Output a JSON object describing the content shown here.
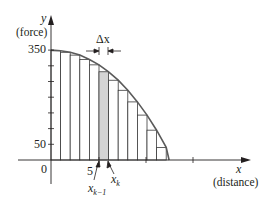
{
  "chart_data": {
    "type": "bar",
    "title": "",
    "xlabel": "x",
    "xlabel_sub": "(distance)",
    "ylabel": "y",
    "ylabel_sub": "(force)",
    "y_tick_labels": [
      "350",
      "50"
    ],
    "y_ticks": [
      350,
      300,
      250,
      200,
      150,
      100,
      50
    ],
    "x_tick_labels": [
      "0",
      "5"
    ],
    "x_ticks": [
      5,
      10,
      15
    ],
    "ylim": [
      0,
      380
    ],
    "xlim": [
      0,
      17
    ],
    "grid": false,
    "legend": null,
    "curve": {
      "description": "force curve, decreasing from 350 at x=0 to 0 near x=12",
      "points": [
        [
          0,
          350
        ],
        [
          1,
          348
        ],
        [
          2,
          343
        ],
        [
          3,
          334
        ],
        [
          4,
          320
        ],
        [
          5,
          303
        ],
        [
          6,
          281
        ],
        [
          7,
          254
        ],
        [
          8,
          222
        ],
        [
          9,
          185
        ],
        [
          10,
          143
        ],
        [
          11,
          95
        ],
        [
          12,
          40
        ],
        [
          12.3,
          0
        ]
      ]
    },
    "bars": {
      "count": 12,
      "width": 1,
      "x_left": [
        0,
        1,
        2,
        3,
        4,
        5,
        6,
        7,
        8,
        9,
        10,
        11
      ],
      "heights": [
        348,
        343,
        334,
        320,
        303,
        281,
        254,
        222,
        185,
        143,
        95,
        40
      ],
      "highlighted_index": 5
    },
    "annotations": [
      "Δx",
      "x_{k-1}",
      "x_k",
      "5"
    ]
  },
  "labels": {
    "y_axis": "y",
    "y_axis_unit": "(force)",
    "x_axis": "x",
    "x_axis_unit": "(distance)",
    "tick_350": "350",
    "tick_50": "50",
    "origin": "0",
    "tick_5": "5",
    "delta_x": "Δx",
    "x_k_minus_1_base": "x",
    "x_k_minus_1_sub": "k−1",
    "x_k_base": "x",
    "x_k_sub": "k"
  },
  "colors": {
    "line": "#231f20",
    "curve": "#5a5a5a",
    "highlight": "#d4d4d4",
    "bar_stroke": "#3a3a3a"
  }
}
